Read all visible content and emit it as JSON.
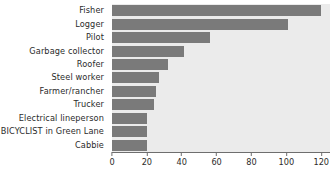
{
  "chart_data": {
    "type": "bar",
    "orientation": "horizontal",
    "title": "",
    "xlabel": "",
    "ylabel": "",
    "categories": [
      "Fisher",
      "Logger",
      "Pilot",
      "Garbage collector",
      "Roofer",
      "Steel worker",
      "Farmer/rancher",
      "Trucker",
      "Electrical lineperson",
      "BICYCLIST in Green Lane",
      "Cabbie"
    ],
    "values": [
      120,
      101,
      56,
      41,
      32,
      27,
      25,
      24,
      20,
      20,
      20
    ],
    "xlim": [
      0,
      125
    ],
    "xticks": [
      0,
      20,
      40,
      60,
      80,
      100,
      120
    ],
    "xtick_labels": [
      "0",
      "20",
      "40",
      "60",
      "80",
      "100",
      "120"
    ],
    "grid": false,
    "legend": false,
    "bar_color": "#7a7a7a",
    "plot_background": "#ebebeb",
    "figure_background": "#ffffff",
    "axis_color": "#6e6e6e",
    "text_color": "#2b2b2b"
  }
}
